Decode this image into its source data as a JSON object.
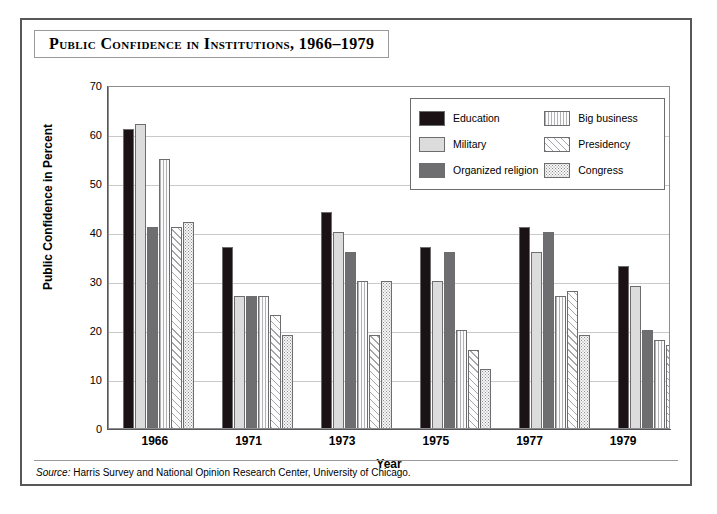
{
  "figure": {
    "title": "Public Confidence in Institutions, 1966–1979",
    "source_lead": "Source:",
    "source_text": " Harris Survey and National Opinion Research Center, University of Chicago."
  },
  "chart_data": {
    "type": "bar",
    "title": "Public Confidence in Institutions, 1966–1979",
    "xlabel": "Year",
    "ylabel": "Public Confidence in Percent",
    "categories": [
      "1966",
      "1971",
      "1973",
      "1975",
      "1977",
      "1979"
    ],
    "ylim": [
      0,
      70
    ],
    "yticks": [
      0,
      10,
      20,
      30,
      40,
      50,
      60,
      70
    ],
    "grid": true,
    "legend_position": "upper-right-inside",
    "series": [
      {
        "name": "Education",
        "pattern": "solid-black",
        "color": "#1a1214",
        "values": [
          61,
          37,
          44,
          37,
          41,
          33
        ]
      },
      {
        "name": "Military",
        "pattern": "solid-light-gray",
        "color": "#dcdcdc",
        "values": [
          62,
          27,
          40,
          30,
          36,
          29
        ]
      },
      {
        "name": "Organized religion",
        "pattern": "solid-mid-gray",
        "color": "#6e6e70",
        "values": [
          41,
          27,
          36,
          36,
          40,
          20
        ]
      },
      {
        "name": "Big business",
        "pattern": "vertical-lines",
        "color": "#fbfbfb",
        "values": [
          55,
          27,
          30,
          20,
          27,
          18
        ]
      },
      {
        "name": "Presidency",
        "pattern": "diagonal-hatch",
        "color": "#fdfdfd",
        "values": [
          41,
          23,
          19,
          16,
          28,
          17
        ]
      },
      {
        "name": "Congress",
        "pattern": "stipple-dots",
        "color": "#f6f6f6",
        "values": [
          42,
          19,
          30,
          12,
          19,
          18
        ]
      }
    ]
  }
}
